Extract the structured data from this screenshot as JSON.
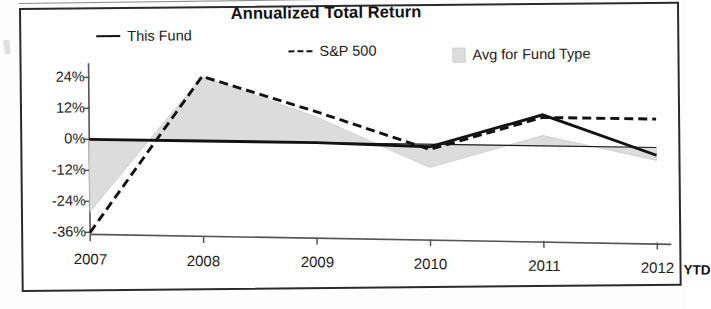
{
  "chart_data": {
    "type": "line",
    "title": "Annualized Total Return",
    "xlabel": "",
    "ylabel": "",
    "grid": false,
    "legend_position": "top",
    "x": [
      "2007",
      "2008",
      "2009",
      "2010",
      "2011",
      "2012"
    ],
    "x_suffix_label": "YTD",
    "ylim": [
      -40,
      28
    ],
    "yticks": [
      24,
      12,
      0,
      -12,
      -24,
      -36
    ],
    "ytick_labels": [
      "24%",
      "12%",
      "0%",
      "-12%",
      "-24%",
      "-36%"
    ],
    "series": [
      {
        "name": "This Fund",
        "style": "solid",
        "color": "#121212",
        "values": [
          0,
          0,
          0,
          -1,
          12,
          -3
        ]
      },
      {
        "name": "S&P 500",
        "style": "dashed",
        "color": "#121212",
        "values": [
          -36,
          25,
          12,
          -2,
          11,
          11
        ]
      },
      {
        "name": "Avg for Fund Type",
        "style": "area",
        "color": "#dcdcdc",
        "values": [
          -28,
          25,
          10,
          -9,
          4,
          -5
        ]
      }
    ]
  },
  "chart": {
    "title": "Annualized Total Return",
    "legend": [
      {
        "label": "This Fund",
        "marker": "solid-line-swatch"
      },
      {
        "label": "S&P 500",
        "marker": "dashed-line-swatch"
      },
      {
        "label": "Avg for Fund Type",
        "marker": "gray-area-swatch"
      }
    ],
    "y_axis": {
      "labels": [
        "24%",
        "12%",
        "0%",
        "-12%",
        "-24%",
        "-36%"
      ]
    },
    "x_axis": {
      "labels": [
        "2007",
        "2008",
        "2009",
        "2010",
        "2011",
        "2012"
      ],
      "trailing_label": "YTD"
    },
    "colors": {
      "line": "#121212",
      "area_fill": "#dcdcdc",
      "axis": "#555555",
      "frame": "#2b2b2b",
      "page": "#fdfdfd"
    }
  }
}
